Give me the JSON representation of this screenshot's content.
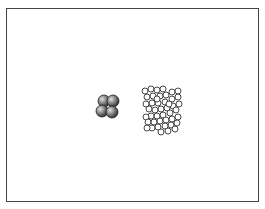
{
  "figure": {
    "background": "#ffffff",
    "frame_color": "#444444",
    "left_cluster": {
      "label": "",
      "style": "shaded-spheres",
      "fill": "#6a6a6a",
      "highlight": "#d8d8d8",
      "spheres": [
        {
          "cx": 104,
          "cy": 101,
          "r": 6
        },
        {
          "cx": 113,
          "cy": 101,
          "r": 6
        },
        {
          "cx": 102,
          "cy": 111,
          "r": 6
        },
        {
          "cx": 112,
          "cy": 112,
          "r": 6
        }
      ]
    },
    "right_cluster": {
      "label": "",
      "style": "open-rings",
      "stroke": "#333333",
      "rings": [
        [
          145,
          91
        ],
        [
          151,
          89
        ],
        [
          157,
          90
        ],
        [
          147,
          97
        ],
        [
          153,
          96
        ],
        [
          160,
          96
        ],
        [
          166,
          95
        ],
        [
          172,
          92
        ],
        [
          178,
          91
        ],
        [
          178,
          97
        ],
        [
          172,
          99
        ],
        [
          165,
          102
        ],
        [
          158,
          103
        ],
        [
          152,
          103
        ],
        [
          146,
          104
        ],
        [
          149,
          109
        ],
        [
          155,
          110
        ],
        [
          161,
          109
        ],
        [
          167,
          108
        ],
        [
          173,
          106
        ],
        [
          179,
          104
        ],
        [
          176,
          110
        ],
        [
          170,
          113
        ],
        [
          163,
          115
        ],
        [
          157,
          116
        ],
        [
          151,
          116
        ],
        [
          146,
          117
        ],
        [
          148,
          122
        ],
        [
          154,
          122
        ],
        [
          160,
          121
        ],
        [
          166,
          120
        ],
        [
          172,
          119
        ],
        [
          178,
          117
        ],
        [
          177,
          123
        ],
        [
          171,
          125
        ],
        [
          165,
          126
        ],
        [
          158,
          127
        ],
        [
          152,
          128
        ],
        [
          147,
          128
        ],
        [
          161,
          132
        ],
        [
          168,
          131
        ],
        [
          175,
          129
        ],
        [
          157,
          99
        ],
        [
          169,
          104
        ],
        [
          163,
          89
        ]
      ],
      "r": 3
    }
  }
}
